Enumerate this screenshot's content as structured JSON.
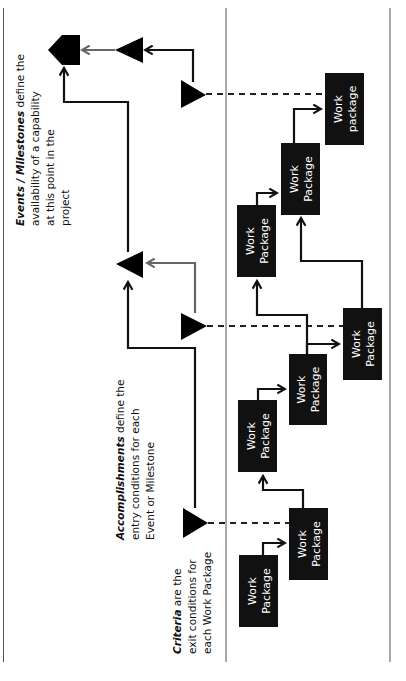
{
  "diagram": {
    "orientation": "rotated 90deg counter-clockwise",
    "annotations": {
      "events": {
        "emphasis": "Events / Milestones",
        "line1_rest": " define the",
        "line2": "availability of a capability",
        "line3": "at this point in the",
        "line4": "project"
      },
      "accomplishments": {
        "emphasis": "Accomplishments",
        "line1_rest": " define the",
        "line2": "entry conditions for each",
        "line3": "Event or Milestone"
      },
      "criteria": {
        "emphasis": "Criteria",
        "line1_rest": " are the",
        "line2": "exit conditions for",
        "line3": "each Work Package"
      }
    },
    "work_packages": [
      {
        "line1": "Work",
        "line2": "package"
      },
      {
        "line1": "Work",
        "line2": "Package"
      },
      {
        "line1": "Work",
        "line2": "Package"
      },
      {
        "line1": "Work",
        "line2": "Package"
      },
      {
        "line1": "Work",
        "line2": "Package"
      },
      {
        "line1": "Work",
        "line2": "Package"
      },
      {
        "line1": "Work",
        "line2": "Package"
      },
      {
        "line1": "Work",
        "line2": "Package"
      }
    ],
    "colors": {
      "box_fill": "#111111",
      "box_text": "#ffffff",
      "connector": "#111111",
      "secondary_connector": "#666666",
      "frame": "#555555"
    }
  }
}
